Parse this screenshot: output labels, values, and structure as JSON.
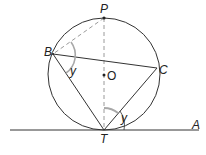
{
  "diagram": {
    "type": "circle-theorem",
    "colors": {
      "line": "#333333",
      "dashed": "#9a9a9a",
      "arc_highlight": "#a8a8a8",
      "background": "#ffffff"
    },
    "circle": {
      "center_label": "O",
      "cx": 104,
      "cy": 74,
      "r": 56
    },
    "points": {
      "P": {
        "label": "P",
        "x": 104,
        "y": 18
      },
      "B": {
        "label": "B",
        "x": 53,
        "y": 54
      },
      "C": {
        "label": "C",
        "x": 157,
        "y": 68
      },
      "T": {
        "label": "T",
        "x": 104,
        "y": 130
      },
      "O": {
        "label": "O",
        "x": 104,
        "y": 75
      },
      "A": {
        "label": "A",
        "x": 196,
        "y": 130
      }
    },
    "lines": [
      {
        "from": "B",
        "to": "C",
        "style": "solid"
      },
      {
        "from": "B",
        "to": "T",
        "style": "solid"
      },
      {
        "from": "C",
        "to": "T",
        "style": "solid"
      },
      {
        "from": "P",
        "to": "T",
        "style": "dashed"
      },
      {
        "from": "P",
        "to": "B",
        "style": "dashed"
      },
      {
        "from": "tangent-start",
        "to": "A",
        "style": "solid"
      }
    ],
    "angles": [
      {
        "vertex": "B",
        "label": "y"
      },
      {
        "vertex": "T",
        "label": "y"
      }
    ],
    "labels": {
      "P": "P",
      "B": "B",
      "C": "C",
      "O": "O",
      "T": "T",
      "A": "A",
      "angle_B": "y",
      "angle_T": "y"
    }
  }
}
